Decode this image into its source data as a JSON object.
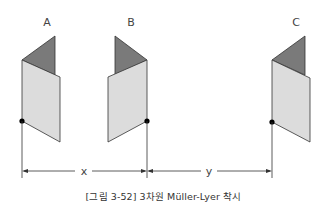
{
  "figure": {
    "labels": {
      "a": "A",
      "b": "B",
      "c": "C"
    },
    "dimensions": {
      "x": "x",
      "y": "y"
    },
    "caption": "[그림 3-52] 3차원 Müller-Lyer 착시",
    "colors": {
      "flap": "#7a7a7a",
      "panel": "#dcdcdc",
      "outline": "#333333",
      "dot": "#000000"
    }
  }
}
